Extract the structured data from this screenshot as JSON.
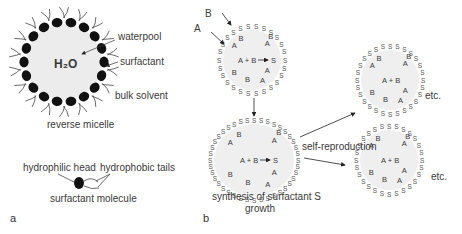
{
  "panel_a": {
    "panel_label": "a",
    "reverse_micelle": {
      "core_label": "H₂O",
      "labels": {
        "waterpool": "waterpool",
        "surfactant": "surfactant",
        "bulk_solvent": "bulk solvent"
      },
      "caption": "reverse micelle"
    },
    "surfactant_molecule": {
      "head_label": "hydrophilic head",
      "tails_label": "hydrophobic tails",
      "caption": "surfactant molecule"
    }
  },
  "panel_b": {
    "panel_label": "b",
    "inputs": [
      "A",
      "B"
    ],
    "reaction": "A + B",
    "product": "S",
    "step1_caption": "synthesis of surfactant S",
    "step2_caption": "growth",
    "branch_label": "self-reproduction",
    "continuation": "etc."
  },
  "colors": {
    "head": "#111111",
    "core_fill": "#ececec",
    "text": "#3a3a3a",
    "line": "#333333"
  }
}
